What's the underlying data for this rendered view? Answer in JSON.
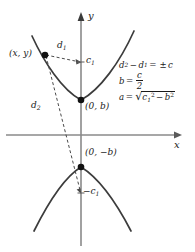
{
  "figure": {
    "background_color": "#ffffff",
    "ink_color": "#1a1a1a",
    "axis_color": "#808080",
    "curve_color": "#3c3c3c"
  },
  "axes": {
    "x_label": "x",
    "y_label": "y",
    "origin": {
      "x": 81,
      "y": 135
    },
    "x_axis": {
      "x1": 6,
      "y1": 135,
      "x2": 182,
      "y2": 135
    },
    "y_axis": {
      "x1": 81,
      "y1": 246,
      "x2": 81,
      "y2": 13
    }
  },
  "points": [
    {
      "name": "point-xy",
      "label": "(x, y)",
      "x": 45,
      "y": 55,
      "label_x": 10,
      "label_y": 50,
      "marker": true
    },
    {
      "name": "vertex-upper",
      "label": "(0, b)",
      "x": 81,
      "y": 100,
      "label_x": 84,
      "label_y": 104,
      "marker": true
    },
    {
      "name": "vertex-lower",
      "label": "(0, −b)",
      "x": 81,
      "y": 167,
      "label_x": 84,
      "label_y": 150,
      "marker": true
    },
    {
      "name": "focus-upper-tick",
      "label": "c1",
      "x": 81,
      "y": 62,
      "label_x": 85,
      "label_y": 57,
      "marker": false
    },
    {
      "name": "focus-lower-tick",
      "label": "−c1",
      "x": 81,
      "y": 193,
      "label_x": 83,
      "label_y": 189,
      "marker": false
    }
  ],
  "labels": {
    "point_xy": "(x, y)",
    "vertex_upper": "(0, b)",
    "vertex_lower": "(0, −b)",
    "distance_1": "d",
    "distance_1_sub": "1",
    "distance_2": "d",
    "distance_2_sub": "2",
    "focus_upper": "c",
    "focus_upper_sub": "1",
    "focus_lower_sign": "−",
    "focus_lower": "c",
    "focus_lower_sub": "1",
    "axis_x": "x",
    "axis_y": "y"
  },
  "dashed_segments": [
    {
      "name": "segment-d1",
      "from": {
        "x": 45,
        "y": 55
      },
      "to": {
        "x": 81,
        "y": 62
      },
      "label": "d1",
      "label_x": 58,
      "label_y": 44
    },
    {
      "name": "segment-d2",
      "from": {
        "x": 45,
        "y": 55
      },
      "to": {
        "x": 81,
        "y": 193
      },
      "label": "d2",
      "label_x": 33,
      "label_y": 104
    }
  ],
  "formulas": {
    "eq1": {
      "lhs_d": "d",
      "lhs_sub": "2",
      "minus": "−",
      "rhs_d": "d",
      "rhs_sub": "1",
      "equals": "=",
      "pm": "±",
      "c": "c"
    },
    "eq2": {
      "b": "b",
      "equals": "=",
      "numerator": "c",
      "denominator": "2"
    },
    "eq3": {
      "a": "a",
      "equals": "=",
      "radical": "√",
      "c": "c",
      "c_sub": "1",
      "c_sup": "2",
      "minus": "−",
      "b": "b",
      "b_sup": "2"
    }
  },
  "curves": {
    "upper_branch": {
      "name": "upper-hyperbola-branch",
      "vertex": "(0, b)",
      "path": "M 32,36 C 44,62 62,90 81,100 C 100,90 120,62 134,31"
    },
    "lower_branch": {
      "name": "lower-hyperbola-branch",
      "vertex": "(0, -b)",
      "path": "M 34,231 C 47,205 63,178 81,167 C 99,178 117,204 131,231"
    }
  }
}
